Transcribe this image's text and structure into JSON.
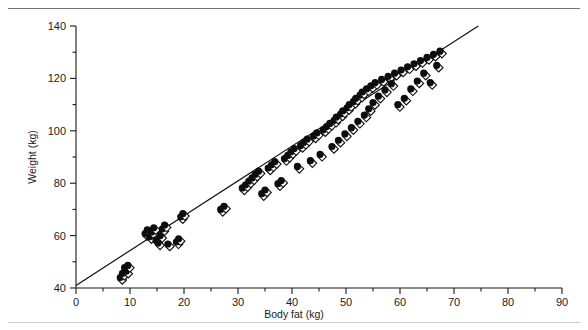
{
  "figure": {
    "has_top_rule": true,
    "has_bottom_rule": true,
    "background_color": "#ffffff",
    "marker_color": "#0d0d0d",
    "line_color": "#111111"
  },
  "chart_data": {
    "type": "scatter",
    "title": "",
    "xlabel": "Body fat (kg)",
    "ylabel": "Weight (kg)",
    "xlim": [
      0,
      90
    ],
    "ylim": [
      40,
      140
    ],
    "xticks": [
      0,
      10,
      20,
      30,
      40,
      50,
      60,
      70,
      80,
      90
    ],
    "xticklabels": [
      "0",
      "10",
      "20",
      "30",
      "40",
      "50",
      "60",
      "70",
      "80",
      "90"
    ],
    "xminorticks": [
      5,
      15,
      25,
      35,
      45,
      55,
      65,
      75,
      85
    ],
    "yticks": [
      40,
      60,
      80,
      100,
      120,
      140
    ],
    "yticklabels": [
      "40",
      "60",
      "80",
      "100",
      "120",
      "140"
    ],
    "yminorticks": [
      50,
      70,
      90,
      110,
      130
    ],
    "grid": false,
    "legend": null,
    "marker_style": "filled-circle-with-open-diamond",
    "fit_line": {
      "type": "linear-regression",
      "x_start": 0.0,
      "y_start": 41.0,
      "x_end": 74.5,
      "y_end": 140.0,
      "slope": 1.329,
      "intercept": 41.0
    },
    "series": [
      {
        "name": "Subjects",
        "x": [
          8.2,
          8.6,
          9.0,
          9.3,
          9.6,
          12.8,
          13.2,
          13.6,
          14.0,
          14.4,
          14.8,
          15.2,
          15.6,
          16.0,
          16.4,
          17.0,
          18.6,
          19.0,
          19.4,
          19.8,
          26.8,
          27.4,
          30.8,
          31.4,
          32.0,
          32.6,
          33.2,
          33.8,
          34.4,
          35.0,
          35.6,
          36.2,
          36.8,
          37.4,
          38.0,
          38.6,
          39.2,
          39.8,
          40.4,
          41.0,
          41.6,
          42.2,
          42.8,
          43.4,
          44.0,
          44.6,
          45.2,
          45.8,
          46.4,
          47.0,
          47.4,
          47.8,
          48.2,
          48.6,
          49.0,
          49.4,
          49.8,
          50.2,
          50.6,
          51.0,
          51.4,
          51.8,
          52.2,
          52.6,
          53.0,
          53.4,
          53.8,
          54.2,
          54.6,
          55.0,
          55.4,
          56.0,
          56.6,
          57.2,
          57.8,
          58.4,
          59.0,
          59.6,
          60.2,
          60.8,
          61.4,
          62.0,
          62.6,
          63.2,
          63.8,
          64.4,
          65.0,
          65.6,
          66.2,
          66.8,
          67.4
        ],
        "y": [
          44.0,
          45.6,
          47.8,
          46.4,
          48.6,
          60.8,
          62.2,
          59.6,
          61.4,
          63.0,
          58.4,
          57.2,
          60.0,
          62.6,
          64.0,
          56.8,
          57.6,
          58.8,
          67.2,
          68.4,
          70.0,
          71.2,
          78.2,
          79.4,
          80.8,
          82.0,
          83.4,
          84.6,
          76.0,
          77.4,
          85.8,
          87.0,
          88.2,
          79.8,
          81.0,
          89.4,
          90.6,
          92.0,
          93.2,
          86.4,
          94.4,
          95.6,
          96.8,
          88.6,
          98.0,
          99.2,
          91.0,
          100.4,
          101.6,
          102.8,
          94.0,
          104.0,
          105.2,
          96.4,
          106.4,
          107.6,
          98.8,
          108.8,
          110.0,
          101.2,
          111.2,
          112.4,
          103.6,
          113.6,
          114.8,
          106.0,
          116.0,
          108.4,
          117.2,
          110.8,
          118.4,
          113.2,
          119.6,
          115.6,
          120.8,
          118.0,
          122.0,
          110.0,
          123.2,
          112.4,
          124.4,
          116.0,
          125.6,
          119.0,
          126.8,
          122.0,
          128.0,
          118.4,
          129.2,
          125.0,
          130.4
        ]
      }
    ]
  }
}
